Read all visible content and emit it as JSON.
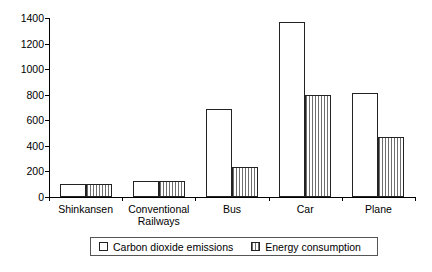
{
  "chart_data": {
    "type": "bar",
    "title": "",
    "xlabel": "",
    "ylabel": "",
    "ylim": [
      0,
      1400
    ],
    "yticks": [
      0,
      200,
      400,
      600,
      800,
      1000,
      1200,
      1400
    ],
    "ytick_labels": [
      "0",
      "200",
      "400",
      "600",
      "800",
      "1000",
      "1200",
      "1400"
    ],
    "grid": false,
    "legend_position": "bottom",
    "categories": [
      "Shinkansen",
      "Conventional Railways",
      "Bus",
      "Car",
      "Plane"
    ],
    "category_label_lines": [
      [
        "Shinkansen"
      ],
      [
        "Conventional",
        "Railways"
      ],
      [
        "Bus"
      ],
      [
        "Car"
      ],
      [
        "Plane"
      ]
    ],
    "series": [
      {
        "name": "Carbon dioxide emissions",
        "fill": "white",
        "values": [
          100,
          128,
          685,
          1370,
          810
        ]
      },
      {
        "name": "Energy consumption",
        "fill": "vertical-hatch",
        "values": [
          105,
          125,
          235,
          800,
          470
        ]
      }
    ]
  },
  "legend": {
    "items": [
      {
        "label": "Carbon dioxide emissions",
        "swatch": "white-square-icon"
      },
      {
        "label": "Energy consumption",
        "swatch": "hatched-square-icon"
      }
    ]
  },
  "colors": {
    "axis": "#000000",
    "bar_outline": "#222222",
    "bar_fill": "#ffffff",
    "hatch_line": "#6e6e6e",
    "background": "#ffffff",
    "legend_border": "#555555"
  }
}
